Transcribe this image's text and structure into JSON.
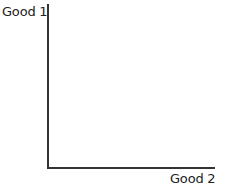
{
  "chart_data": {
    "type": "line",
    "title": "",
    "xlabel": "Good 2",
    "ylabel": "Good 1",
    "series": [],
    "grid": false,
    "legend": null
  }
}
